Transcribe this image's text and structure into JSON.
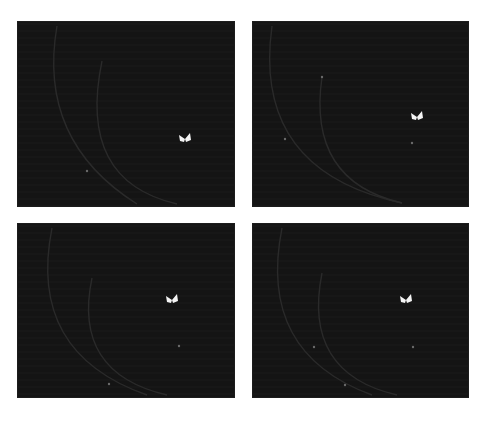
{
  "figure": {
    "caption": "",
    "background": "#ffffff",
    "panel_background": "#141414",
    "panels": [
      {
        "id": "top-left",
        "x": 17,
        "y": 21,
        "w": 218,
        "h": 186,
        "butterfly": {
          "x": 168,
          "y": 118
        },
        "dots": [
          {
            "x": 70,
            "y": 150
          }
        ],
        "arcs": [
          "M 40 5 Q 20 120 120 183",
          "M 85 40 Q 60 160 160 183"
        ]
      },
      {
        "id": "top-right",
        "x": 252,
        "y": 21,
        "w": 217,
        "h": 186,
        "butterfly": {
          "x": 165,
          "y": 96
        },
        "dots": [
          {
            "x": 160,
            "y": 122
          },
          {
            "x": 70,
            "y": 56
          },
          {
            "x": 33,
            "y": 118
          }
        ],
        "arcs": [
          "M 20 5 Q 0 150 150 182",
          "M 70 56 Q 55 160 150 182"
        ]
      },
      {
        "id": "bottom-left",
        "x": 17,
        "y": 223,
        "w": 218,
        "h": 175,
        "butterfly": {
          "x": 155,
          "y": 77
        },
        "dots": [
          {
            "x": 162,
            "y": 123
          },
          {
            "x": 92,
            "y": 161
          }
        ],
        "arcs": [
          "M 35 5 Q 10 130 130 172",
          "M 75 55 Q 55 150 150 172"
        ]
      },
      {
        "id": "bottom-right",
        "x": 252,
        "y": 223,
        "w": 217,
        "h": 175,
        "butterfly": {
          "x": 154,
          "y": 77
        },
        "dots": [
          {
            "x": 161,
            "y": 124
          },
          {
            "x": 62,
            "y": 124
          },
          {
            "x": 93,
            "y": 162
          }
        ],
        "arcs": [
          "M 30 5 Q 5 130 120 172",
          "M 70 50 Q 50 150 145 172"
        ]
      }
    ]
  }
}
